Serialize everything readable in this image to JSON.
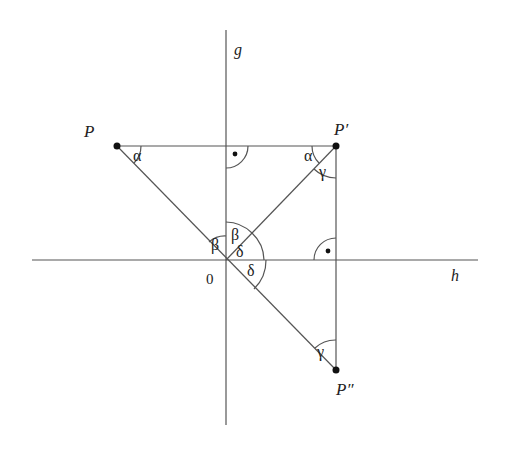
{
  "diagram": {
    "axes": {
      "vertical_label": "g",
      "horizontal_label": "h",
      "origin_label": "0"
    },
    "points": {
      "P": "P",
      "P_prime": "P′",
      "P_double_prime": "P″"
    },
    "angles": {
      "alpha_at_P": "α",
      "alpha_at_P_prime": "α",
      "gamma_at_P_prime": "γ",
      "gamma_at_P_double_prime": "γ",
      "beta_left_origin": "β",
      "beta_right_origin": "β",
      "delta_upper_origin": "δ",
      "delta_lower_origin": "δ"
    },
    "right_angle_marker": "•"
  }
}
